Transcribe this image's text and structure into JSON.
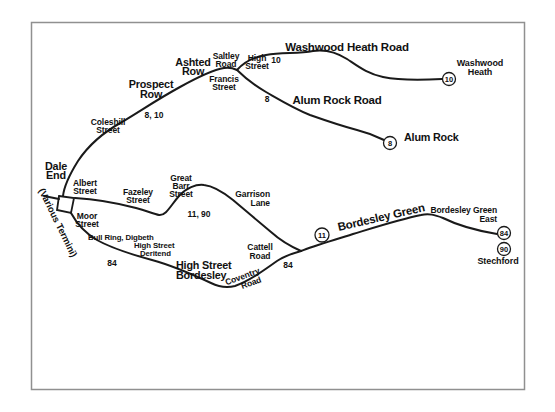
{
  "map": {
    "colors": {
      "line": "#1a1a1a",
      "border": "#909090",
      "text": "#111111",
      "background": "#ffffff",
      "badge_fill": "#ffffff"
    },
    "major_roads": {
      "washwood_heath_road": "Washwood Heath Road",
      "alum_rock_road": "Alum Rock Road",
      "bordesley_green": "Bordesley Green",
      "prospect_row": [
        "Prospect",
        "Row"
      ],
      "ashted_row": [
        "Ashted",
        "Row"
      ],
      "dale_end": [
        "Dale",
        "End"
      ],
      "high_street_bordesley": [
        "High Street",
        "Bordesley"
      ]
    },
    "streets": {
      "coleshill_street": [
        "Coleshill",
        "Street"
      ],
      "saltley_road": [
        "Saltley",
        "Road"
      ],
      "high_street": [
        "High",
        "Street"
      ],
      "francis_street": [
        "Francis",
        "Street"
      ],
      "albert_street": [
        "Albert",
        "Street"
      ],
      "moor_street": [
        "Moor",
        "Street"
      ],
      "fazeley_street": [
        "Fazeley",
        "Street"
      ],
      "great_barr_street": [
        "Great",
        "Barr",
        "Street"
      ],
      "garrison_lane": [
        "Garrison",
        "Lane"
      ],
      "cattell_road": [
        "Cattell",
        "Road"
      ],
      "coventry_road": [
        "Coventry",
        "Road"
      ],
      "digbeth_block": [
        "Bull Ring, Digbeth",
        "High Street",
        "Deritend"
      ],
      "bordesley_green_east": [
        "Bordesley Green",
        "East"
      ]
    },
    "route_numbers": {
      "coleshill": "8, 10",
      "washwood_branch": "10",
      "alum_branch": "8",
      "fazeley": "11, 90",
      "digbeth": "84",
      "coventry": "84"
    },
    "termini": {
      "washwood_heath": {
        "badge": "10",
        "label": [
          "Washwood",
          "Heath"
        ]
      },
      "alum_rock": {
        "badge": "8",
        "label": "Alum Rock"
      },
      "stechford": {
        "badges": [
          "84",
          "90"
        ],
        "label": "Stechford"
      },
      "bordesley_midroute": {
        "badge": "11"
      },
      "city": {
        "label": "(Various Termini)"
      }
    }
  }
}
